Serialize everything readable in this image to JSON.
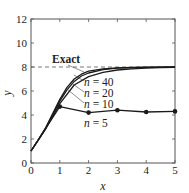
{
  "chart_data": {
    "type": "line",
    "title": "",
    "xlabel": "x",
    "ylabel": "y",
    "xlim": [
      0,
      5
    ],
    "ylim": [
      0,
      12
    ],
    "xticks": [
      0,
      1,
      2,
      3,
      4,
      5
    ],
    "yticks": [
      0,
      2,
      4,
      6,
      8,
      10,
      12
    ],
    "grid": false,
    "legend": "inline labels",
    "series": [
      {
        "name": "Exact",
        "style": "dashed",
        "x": [
          0,
          5
        ],
        "y": [
          8,
          8
        ]
      },
      {
        "name": "n = 40",
        "style": "solid",
        "x": [
          0,
          0.25,
          0.5,
          0.75,
          1.0,
          1.25,
          1.5,
          1.75,
          2.0,
          2.5,
          3.0,
          3.5,
          4.0,
          5.0
        ],
        "y": [
          1.0,
          1.9,
          2.9,
          4.1,
          5.3,
          6.3,
          7.0,
          7.4,
          7.65,
          7.85,
          7.93,
          7.96,
          7.98,
          8.0
        ]
      },
      {
        "name": "n = 20",
        "style": "solid",
        "x": [
          0,
          0.25,
          0.5,
          0.75,
          1.0,
          1.25,
          1.5,
          1.75,
          2.0,
          2.5,
          3.0,
          3.5,
          4.0,
          5.0
        ],
        "y": [
          1.0,
          1.9,
          2.85,
          4.0,
          5.15,
          6.1,
          6.8,
          7.25,
          7.5,
          7.78,
          7.9,
          7.95,
          7.97,
          8.0
        ]
      },
      {
        "name": "n = 10",
        "style": "solid",
        "x": [
          0,
          0.5,
          1.0,
          1.5,
          2.0,
          2.5,
          3.0,
          3.5,
          4.0,
          4.5,
          5.0
        ],
        "y": [
          1.0,
          2.8,
          4.95,
          6.5,
          7.2,
          7.55,
          7.75,
          7.85,
          7.9,
          7.95,
          7.97
        ]
      },
      {
        "name": "n = 5",
        "style": "solid-markers",
        "x": [
          0,
          1,
          2,
          3,
          4,
          5
        ],
        "y": [
          1.0,
          4.7,
          4.2,
          4.4,
          4.25,
          4.3
        ]
      }
    ],
    "annotations": [
      {
        "text": "Exact",
        "at": [
          0.55,
          8.8
        ]
      },
      {
        "text": "n = 40",
        "at": [
          2.35,
          6.8
        ]
      },
      {
        "text": "n = 20",
        "at": [
          2.35,
          5.9
        ]
      },
      {
        "text": "n = 10",
        "at": [
          2.35,
          4.95
        ]
      },
      {
        "text": "n = 5",
        "at": [
          1.9,
          3.35
        ]
      }
    ]
  },
  "labels": {
    "xlabel": "x",
    "ylabel": "y",
    "exact": "Exact",
    "n40_n": "n",
    "n40_rest": " = 40",
    "n20_n": "n",
    "n20_rest": " = 20",
    "n10_n": "n",
    "n10_rest": " = 10",
    "n5_n": "n",
    "n5_rest": " = 5"
  }
}
